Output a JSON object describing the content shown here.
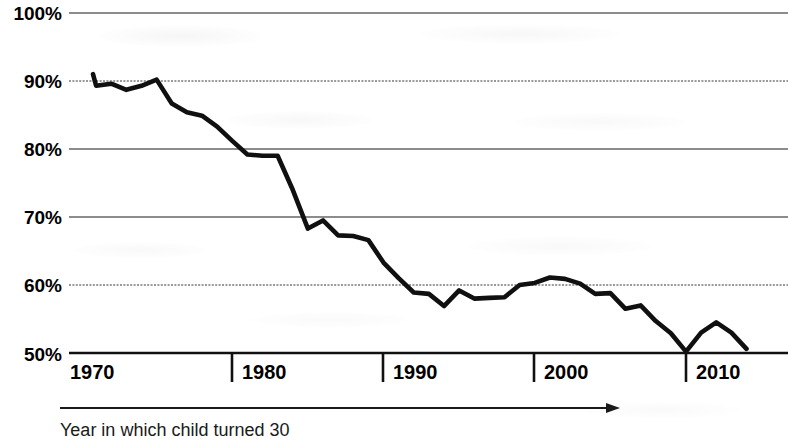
{
  "chart_data": {
    "type": "line",
    "title": "",
    "subtitle": "",
    "xlabel": "Year in which child turned 30",
    "ylabel": "",
    "xlim": [
      1969,
      2014.5
    ],
    "ylim": [
      50,
      100
    ],
    "grid": true,
    "legend": "none",
    "x_tick_labels": [
      "1970",
      "1980",
      "1990",
      "2000",
      "2010"
    ],
    "x_ticks": [
      1970,
      1980,
      1990,
      2000,
      2010
    ],
    "y_tick_labels": [
      "100%",
      "90%",
      "80%",
      "70%",
      "60%",
      "50%"
    ],
    "y_ticks": [
      100,
      90,
      80,
      70,
      60,
      50
    ],
    "series": [
      {
        "name": "Share of children earning more than their parents",
        "color": "#101010",
        "x": [
          1970,
          1971,
          1972,
          1973,
          1974,
          1975,
          1976,
          1977,
          1978,
          1979,
          1980,
          1981,
          1982,
          1983,
          1984,
          1985,
          1986,
          1987,
          1988,
          1989,
          1990,
          1991,
          1992,
          1993,
          1994,
          1995,
          1996,
          1997,
          1998,
          1999,
          2000,
          2001,
          2002,
          2003,
          2004,
          2005,
          2006,
          2007,
          2008,
          2009,
          2010,
          2011,
          2012,
          2013,
          2014
        ],
        "values": [
          91.0,
          89.3,
          89.6,
          88.7,
          89.3,
          90.2,
          86.7,
          85.4,
          84.9,
          83.3,
          81.2,
          79.2,
          79.0,
          79.0,
          74.0,
          68.3,
          69.5,
          67.3,
          67.2,
          66.6,
          63.3,
          61.0,
          58.9,
          58.7,
          56.9,
          59.2,
          58.0,
          58.1,
          58.2,
          60.0,
          60.3,
          61.1,
          60.9,
          60.2,
          58.7,
          58.8,
          56.5,
          57.0,
          54.7,
          52.9,
          50.2,
          53.0,
          54.5,
          53.0,
          50.6
        ]
      }
    ],
    "annotations": [
      {
        "name": "x-axis-direction-arrow",
        "text": ""
      }
    ]
  },
  "axis": {
    "caption": "Year in which child turned 30"
  }
}
